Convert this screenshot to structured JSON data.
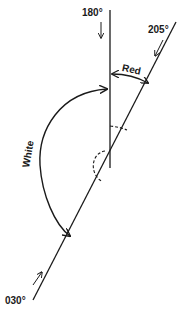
{
  "diagram": {
    "bearings": [
      {
        "label": "180°",
        "value": "180"
      },
      {
        "label": "205°",
        "value": "205"
      },
      {
        "label": "030°",
        "value": "030"
      }
    ],
    "sectors": [
      {
        "label": "Red",
        "from": "180°",
        "to": "205°"
      },
      {
        "label": "White",
        "from": "030°",
        "to": "180°"
      }
    ],
    "colors": {
      "line": "#1a1a1a",
      "background": "#ffffff"
    }
  }
}
